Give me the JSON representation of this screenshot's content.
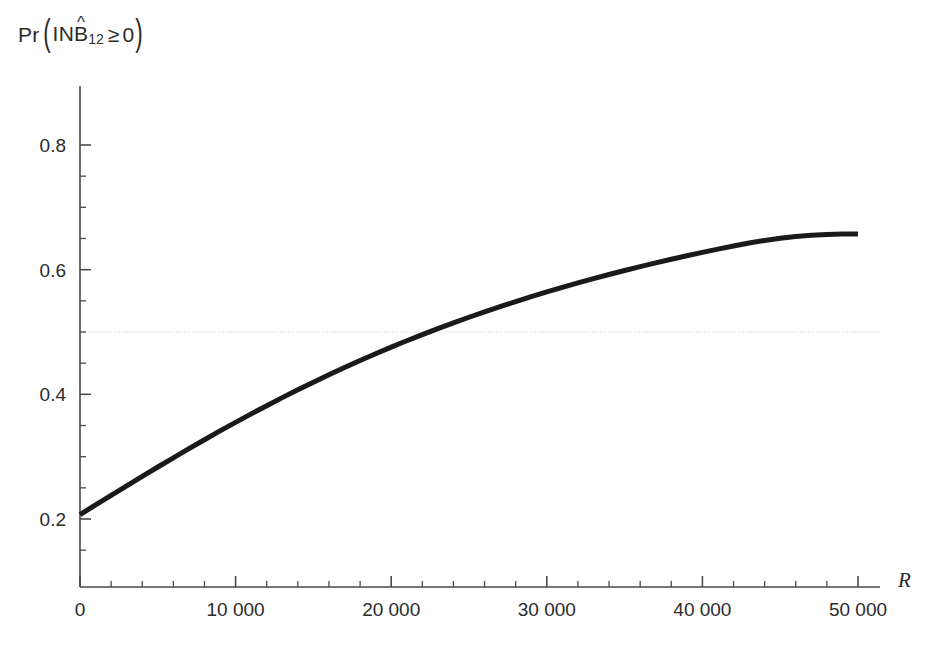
{
  "figure": {
    "background_color": "#ffffff",
    "axis_color": "#4a4a4a",
    "curve_color": "#1a1a1a",
    "gridline_color": "#c8c8c8",
    "title_parts": {
      "pr": "Pr",
      "paren_open": "(",
      "inb": "INB",
      "hat": "^",
      "subscript": "12",
      "geq": "≥",
      "zero": "0",
      "paren_close": ")"
    }
  },
  "chart_data": {
    "type": "line",
    "xlabel": "R",
    "ylabel": "Pr(INB̂₁₂ ≥ 0)",
    "xlim": [
      0,
      50000
    ],
    "ylim": [
      0.13,
      0.845
    ],
    "grid": false,
    "legend": null,
    "x_ticks": [
      0,
      10000,
      20000,
      30000,
      40000,
      50000
    ],
    "x_tick_labels": [
      "0",
      "10 000",
      "20 000",
      "30 000",
      "40 000",
      "50 000"
    ],
    "x_minor_tick_step": 2000,
    "y_ticks": [
      0.2,
      0.4,
      0.6,
      0.8
    ],
    "y_tick_labels": [
      "0.2",
      "0.4",
      "0.6",
      "0.8"
    ],
    "y_minor_tick_step": 0.05,
    "annotations": [
      {
        "type": "hline",
        "y": 0.5,
        "style": "dotted",
        "color": "#c8c8c8",
        "label": "0.5 reference line"
      }
    ],
    "series": [
      {
        "name": "Pr(INB12 >= 0)",
        "line_width": 5,
        "color": "#1a1a1a",
        "x": [
          0,
          1000,
          2000,
          3000,
          4000,
          5000,
          6000,
          7000,
          8000,
          9000,
          10000,
          11000,
          12000,
          13000,
          14000,
          15000,
          16000,
          17000,
          18000,
          19000,
          20000,
          21000,
          22000,
          23000,
          24000,
          25000,
          26000,
          27000,
          28000,
          29000,
          30000,
          31000,
          32000,
          33000,
          34000,
          35000,
          36000,
          37000,
          38000,
          39000,
          40000,
          41000,
          42000,
          43000,
          44000,
          45000,
          46000,
          47000,
          48000,
          49000,
          50000
        ],
        "y": [
          0.207,
          0.2225,
          0.2379,
          0.2532,
          0.2684,
          0.2834,
          0.2982,
          0.3128,
          0.3272,
          0.3413,
          0.3551,
          0.3686,
          0.3818,
          0.3947,
          0.4073,
          0.4195,
          0.4314,
          0.443,
          0.4542,
          0.4651,
          0.4757,
          0.4859,
          0.4958,
          0.5054,
          0.5147,
          0.5237,
          0.5324,
          0.5408,
          0.5489,
          0.5568,
          0.5644,
          0.5717,
          0.5788,
          0.5857,
          0.5923,
          0.5987,
          0.6049,
          0.6109,
          0.6167,
          0.6223,
          0.6277,
          0.6329,
          0.638,
          0.6428,
          0.6469,
          0.6503,
          0.6531,
          0.6553,
          0.6566,
          0.6572,
          0.6574
        ]
      }
    ]
  }
}
